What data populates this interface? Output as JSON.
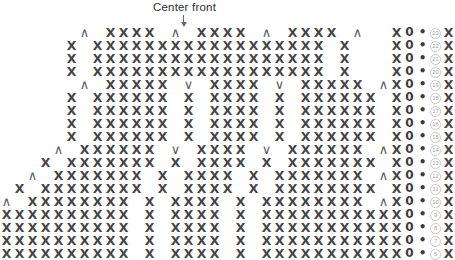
{
  "annotations": {
    "center_front_label": "Center front",
    "arrow_icon": "down-arrow-icon"
  },
  "legend_symbols": {
    "sc": "X",
    "decrease": "∧",
    "increase": "∨",
    "chain": "0",
    "slip_stitch": "•",
    "blank": " "
  },
  "chart_data": {
    "type": "table",
    "xlabel": "",
    "ylabel": "Row",
    "grid": false,
    "columns": 28,
    "row_numbers": [
      23,
      22,
      21,
      20,
      19,
      18,
      17,
      16,
      15,
      14,
      13,
      12,
      11,
      10,
      9,
      8,
      7,
      6
    ],
    "symbol_key": {
      "X": "single crochet",
      "^": "decrease",
      "v": "increase",
      "0": "chain",
      ".": "slip stitch",
      " ": "empty"
    },
    "rows": [
      {
        "number": 23,
        "cells": "  ^ XXXX ^ XXXX ^ XXXX ^  X0."
      },
      {
        "number": 22,
        "cells": " X XXXXXXXXXXXXXXXXXX X   X0."
      },
      {
        "number": 21,
        "cells": " X XXXXXXXXXXXXXXXXXX X   X0."
      },
      {
        "number": 20,
        "cells": " X XXXXXXXXXXXXXXXXXX X   X0."
      },
      {
        "number": 19,
        "cells": "  ^ XXXXX v XXXX v XXXXX ^X0."
      },
      {
        "number": 18,
        "cells": " X XXXXXX X XXXX X XXXXXX X0."
      },
      {
        "number": 17,
        "cells": " X XXXXXX X XXXX X XXXXXX X0."
      },
      {
        "number": 16,
        "cells": " X XXXXXX X XXXX X XXXXXX X0."
      },
      {
        "number": 15,
        "cells": " X XXXXXX X XXXX X XXXXXX X0."
      },
      {
        "number": 14,
        "cells": "  ^ XXXXXX v XXXX v XXXXXX ^X0."
      },
      {
        "number": 13,
        "cells": " X XXXXXXX X XXXX X XXXXXXX X0."
      },
      {
        "number": 12,
        "cells": " ^ XXXXXXX X XXXX X XXXXXXX ^X0."
      },
      {
        "number": 11,
        "cells": "X XXXXXXXX X XXXX X XXXXXXXX X0."
      },
      {
        "number": 10,
        "cells": "^ XXXXXXXX X XXXX X XXXXXXXX ^X0."
      },
      {
        "number": 9,
        "cells": "XXXXXXXXXX X XXXX X XXXXXXXXXXX0."
      },
      {
        "number": 8,
        "cells": "XXXXXXXXXX X XXXX X XXXXXXXXXXX0."
      },
      {
        "number": 7,
        "cells": "XXXXXXXXXX X XXXX X XXXXXXXXXXX0."
      },
      {
        "number": 6,
        "cells": "XXXXXXXXXX X XXXX X XXXXXXXXXXX0."
      }
    ]
  }
}
